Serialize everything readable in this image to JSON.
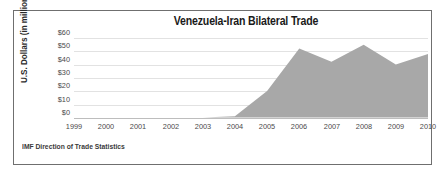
{
  "figure": {
    "title": "Venezuela-Iran Bilateral Trade",
    "source_note": "IMF Direction of Trade Statistics",
    "border_color": "#6f6f6f",
    "background": "#ffffff"
  },
  "axes": {
    "ylabel": "U.S. Dollars (in millions)",
    "yticks": [
      "$60",
      "$50",
      "$40",
      "$30",
      "$20",
      "$10",
      "$0"
    ],
    "xticks": [
      "1999",
      "2000",
      "2001",
      "2002",
      "2003",
      "2004",
      "2005",
      "2006",
      "2007",
      "2008",
      "2009",
      "2010"
    ]
  },
  "chart_data": {
    "type": "area",
    "title": "Venezuela-Iran Bilateral Trade",
    "subtitle": "",
    "xlabel": "",
    "ylabel": "U.S. Dollars (in millions)",
    "x": [
      1999,
      2000,
      2001,
      2002,
      2003,
      2004,
      2005,
      2006,
      2007,
      2008,
      2009,
      2010
    ],
    "categories": [
      "1999",
      "2000",
      "2001",
      "2002",
      "2003",
      "2004",
      "2005",
      "2006",
      "2007",
      "2008",
      "2009",
      "2010"
    ],
    "values": [
      0,
      0,
      0,
      0,
      0,
      1,
      20,
      52,
      42,
      55,
      40,
      48
    ],
    "series": [
      {
        "name": "Venezuela-Iran bilateral trade",
        "values": [
          0,
          0,
          0,
          0,
          0,
          1,
          20,
          52,
          42,
          55,
          40,
          48
        ],
        "fill_color": "#a8a8a8"
      }
    ],
    "ylim": [
      0,
      60
    ],
    "yticks": [
      0,
      10,
      20,
      30,
      40,
      50,
      60
    ],
    "ytick_labels": [
      "$0",
      "$10",
      "$20",
      "$30",
      "$40",
      "$50",
      "$60"
    ],
    "xlim": [
      1999,
      2010
    ],
    "grid": true,
    "grid_axis": "y",
    "legend": false,
    "legend_position": "none",
    "annotations": [
      "IMF Direction of Trade Statistics"
    ]
  }
}
